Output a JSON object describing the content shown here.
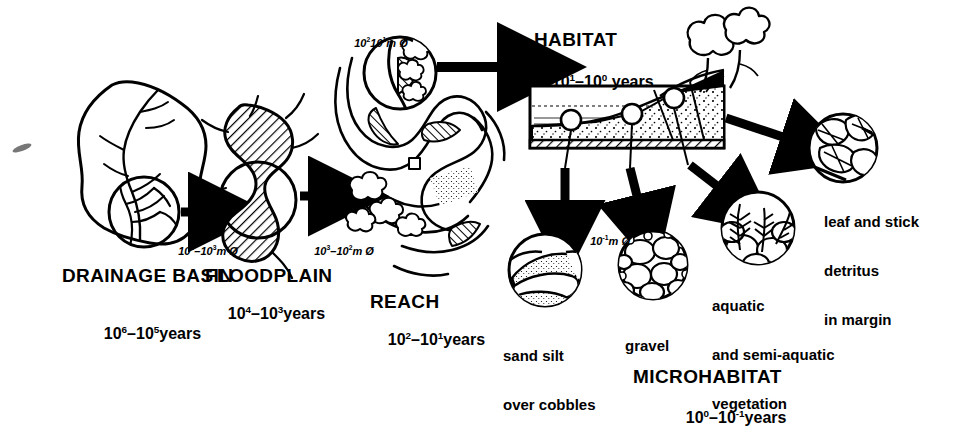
{
  "figure": {
    "type": "scientific-diagram"
  },
  "levels": [
    {
      "id": "drainage-basin",
      "name": "DRAINAGE BASIN",
      "timescale": "10⁶–10⁵ years",
      "time_base": "10",
      "time_exp_hi": "6",
      "time_exp_lo": "5",
      "scale_label": "10⁴–10³ m Ø",
      "scale_base": "10",
      "scale_exp_hi": "4",
      "scale_exp_lo": "3",
      "scale_unit": "m Ø"
    },
    {
      "id": "floodplain",
      "name": "FLOODPLAIN",
      "timescale": "10⁴–10³ years",
      "time_base": "10",
      "time_exp_hi": "4",
      "time_exp_lo": "3",
      "scale_label": "10³–10² m Ø",
      "scale_base": "10",
      "scale_exp_hi": "3",
      "scale_exp_lo": "2",
      "scale_unit": "m Ø"
    },
    {
      "id": "reach",
      "name": "REACH",
      "timescale": "10²–10¹ years",
      "time_base": "10",
      "time_exp_hi": "2",
      "time_exp_lo": "1",
      "scale_label": "10²–10¹ m Ø",
      "scale_base": "10",
      "scale_exp_hi": "2",
      "scale_exp_lo": "1",
      "scale_unit": "m Ø"
    },
    {
      "id": "habitat",
      "name": "HABITAT",
      "timescale": "10¹–10⁰ years",
      "time_base": "10",
      "time_exp_hi": "1",
      "time_exp_lo": "0",
      "scale_label": "10⁻¹ m Ø",
      "scale_base": "10",
      "scale_exp_hi": "-1",
      "scale_unit": "m Ø"
    },
    {
      "id": "microhabitat",
      "name": "MICROHABITAT",
      "timescale": "10⁰–10⁻¹ years",
      "time_base": "10",
      "time_exp_hi": "0",
      "time_exp_lo": "-1"
    }
  ],
  "words": {
    "years": "years",
    "dash": "–",
    "diameter_unit": "m Ø"
  },
  "microhabitat_items": [
    {
      "id": "sand-silt-over-cobbles",
      "line1": "sand silt",
      "line2": "over cobbles",
      "line3": ""
    },
    {
      "id": "gravel",
      "line1": "gravel",
      "line2": "",
      "line3": ""
    },
    {
      "id": "aquatic-vegetation",
      "line1": "aquatic",
      "line2": "and semi-aquatic",
      "line3": "vegetation"
    },
    {
      "id": "leaf-stick-detritus",
      "line1": "leaf and stick",
      "line2": "detritus",
      "line3": "in margin"
    }
  ],
  "colors": {
    "ink": "#000000",
    "paper": "#ffffff",
    "fill_light": "#ffffff"
  }
}
